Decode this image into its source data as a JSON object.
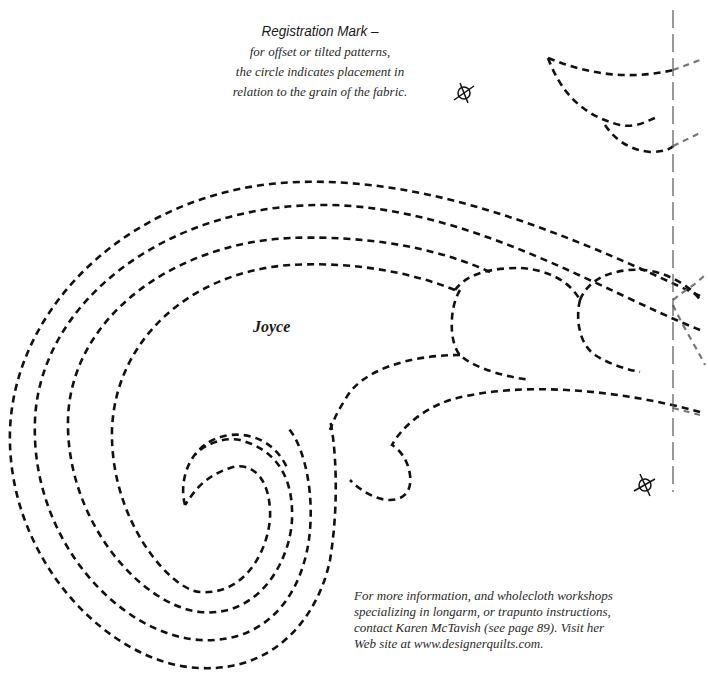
{
  "registration": {
    "title": "Registration Mark –",
    "lines": [
      "for offset or tilted patterns,",
      "the circle indicates placement in",
      "relation to the grain of the fabric."
    ]
  },
  "pattern": {
    "name": "Joyce",
    "stitch_color": "#111111",
    "guide_line_color": "#555555"
  },
  "footer": {
    "lines": [
      "For more information, and wholecloth workshops",
      "specializing in longarm, or trapunto instructions,",
      "contact Karen McTavish (see page 89). Visit her",
      "Web site at www.designerquilts.com."
    ]
  },
  "icons": {
    "registration_marks": [
      "registration-mark-top",
      "registration-mark-bottom"
    ]
  }
}
